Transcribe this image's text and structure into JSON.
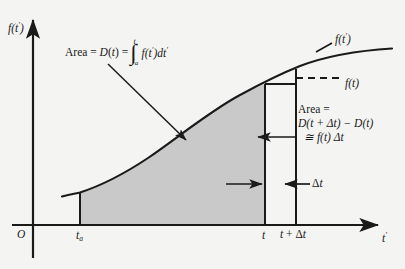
{
  "figure": {
    "kind": "calculus-diagram",
    "background_color": "#f4f4f2",
    "shade_color": "#c9c9c9",
    "ink_color": "#1a1a1a"
  },
  "axes": {
    "y_label": "f(t′)",
    "x_label": "t′",
    "origin_label": "O"
  },
  "ticks": [
    {
      "name": "t_a",
      "text_main": "t",
      "text_sub": "a",
      "x": 80
    },
    {
      "name": "t",
      "text_main": "t",
      "text_sub": "",
      "x": 265
    },
    {
      "name": "t_plus_delta_t",
      "text_main": "t + Δt",
      "text_sub": "",
      "x": 296
    }
  ],
  "curve": {
    "label": "f(t′)",
    "description": "monotonically increasing sigmoid curve"
  },
  "annotations": {
    "area_integral": {
      "lead": "Area = D(t) =",
      "integral_upper": "t",
      "integral_lower": "t",
      "integral_lower_sub": "a",
      "integrand": "f(t′)dt′"
    },
    "f_of_t": "f(t)",
    "delta_t": "Δt",
    "strip_area": {
      "line1": "Area =",
      "line2": "D(t + Δt) − D(t)",
      "line3": "≅ f(t) Δt"
    }
  },
  "chart_data": {
    "type": "line",
    "title": "",
    "xlabel": "t′",
    "ylabel": "f(t′)",
    "grid": false,
    "legend": "none",
    "xlim": [
      0,
      405
    ],
    "ylim": [
      0,
      225
    ],
    "series": [
      {
        "name": "f(t')",
        "x": [
          62,
          90,
          120,
          150,
          180,
          210,
          240,
          265,
          296,
          330,
          360,
          392
        ],
        "y": [
          196,
          190,
          178,
          161,
          140,
          118,
          98,
          85,
          73,
          62,
          55,
          50
        ]
      }
    ],
    "shaded_region": {
      "label": "D(t)",
      "from_x": 80,
      "to_x": 265,
      "baseline_y": 225
    },
    "strip_region": {
      "label": "D(t + Δt) − D(t)",
      "from_x": 265,
      "to_x": 296
    }
  }
}
